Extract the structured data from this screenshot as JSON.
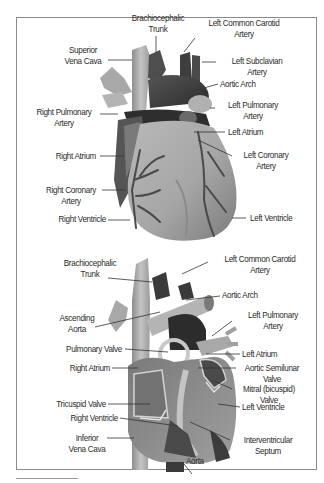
{
  "figure": {
    "top_view": {
      "name": "external-heart",
      "labels": [
        {
          "id": "brachiocephalic-trunk",
          "lines": [
            "Brachiocephalic",
            "Trunk"
          ]
        },
        {
          "id": "left-common-carotid-artery",
          "lines": [
            "Left Common Carotid",
            "Artery"
          ]
        },
        {
          "id": "superior-vena-cava",
          "lines": [
            "Superior",
            "Vena Cava"
          ]
        },
        {
          "id": "left-subclavian-artery",
          "lines": [
            "Left Subclavian",
            "Artery"
          ]
        },
        {
          "id": "aortic-arch",
          "lines": [
            "Aortic Arch"
          ]
        },
        {
          "id": "right-pulmonary-artery",
          "lines": [
            "Right Pulmonary",
            "Artery"
          ]
        },
        {
          "id": "left-pulmonary-artery",
          "lines": [
            "Left Pulmonary",
            "Artery"
          ]
        },
        {
          "id": "left-atrium",
          "lines": [
            "Left Atrium"
          ]
        },
        {
          "id": "right-atrium",
          "lines": [
            "Right Atrium"
          ]
        },
        {
          "id": "left-coronary-artery",
          "lines": [
            "Left Coronary",
            "Artery"
          ]
        },
        {
          "id": "right-coronary-artery",
          "lines": [
            "Right Coronary",
            "Artery"
          ]
        },
        {
          "id": "right-ventricle",
          "lines": [
            "Right Ventricle"
          ]
        },
        {
          "id": "left-ventricle",
          "lines": [
            "Left Ventricle"
          ]
        }
      ]
    },
    "bottom_view": {
      "name": "internal-heart-section",
      "labels": [
        {
          "id": "brachiocephalic-trunk",
          "lines": [
            "Brachiocephalic",
            "Trunk"
          ]
        },
        {
          "id": "left-common-carotid-artery",
          "lines": [
            "Left Common Carotid",
            "Artery"
          ]
        },
        {
          "id": "aortic-arch",
          "lines": [
            "Aortic Arch"
          ]
        },
        {
          "id": "ascending-aorta",
          "lines": [
            "Ascending",
            "Aorta"
          ]
        },
        {
          "id": "left-pulmonary-artery",
          "lines": [
            "Left Pulmonary",
            "Artery"
          ]
        },
        {
          "id": "pulmonary-valve",
          "lines": [
            "Pulmonary Valve"
          ]
        },
        {
          "id": "left-atrium",
          "lines": [
            "Left Atrium"
          ]
        },
        {
          "id": "right-atrium",
          "lines": [
            "Right Atrium"
          ]
        },
        {
          "id": "aortic-semilunar-valve",
          "lines": [
            "Aortic Semilunar",
            "Valve"
          ]
        },
        {
          "id": "mitral-valve",
          "lines": [
            "Mitral (bicuspid)",
            "Valve"
          ]
        },
        {
          "id": "tricuspid-valve",
          "lines": [
            "Tricuspid Valve"
          ]
        },
        {
          "id": "left-ventricle",
          "lines": [
            "Left Ventricle"
          ]
        },
        {
          "id": "right-ventricle",
          "lines": [
            "Right Ventricle"
          ]
        },
        {
          "id": "inferior-vena-cava",
          "lines": [
            "Inferior",
            "Vena Cava"
          ]
        },
        {
          "id": "interventricular-septum",
          "lines": [
            "Interventricular",
            "Septum"
          ]
        },
        {
          "id": "aorta",
          "lines": [
            "Aorta"
          ]
        }
      ]
    }
  },
  "colors": {
    "frame": "#8a8a8a",
    "text": "#2a2a2a",
    "leader": "#333333",
    "tissue_light": "#c8c8c8",
    "tissue_mid": "#9a9a9a",
    "tissue_dark": "#4a4a4a",
    "tissue_darkest": "#2a2a2a"
  }
}
